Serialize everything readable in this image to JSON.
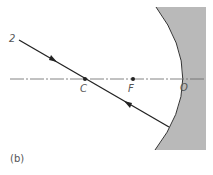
{
  "diagram": {
    "caption": "(b)",
    "labels": {
      "ray": "2",
      "center": "C",
      "focus": "F",
      "vertex": "O"
    },
    "colors": {
      "mirror_fill": "#b9b9b9",
      "mirror_edge": "#333333",
      "ray": "#222222",
      "axis": "#666666",
      "text": "#555555"
    }
  }
}
